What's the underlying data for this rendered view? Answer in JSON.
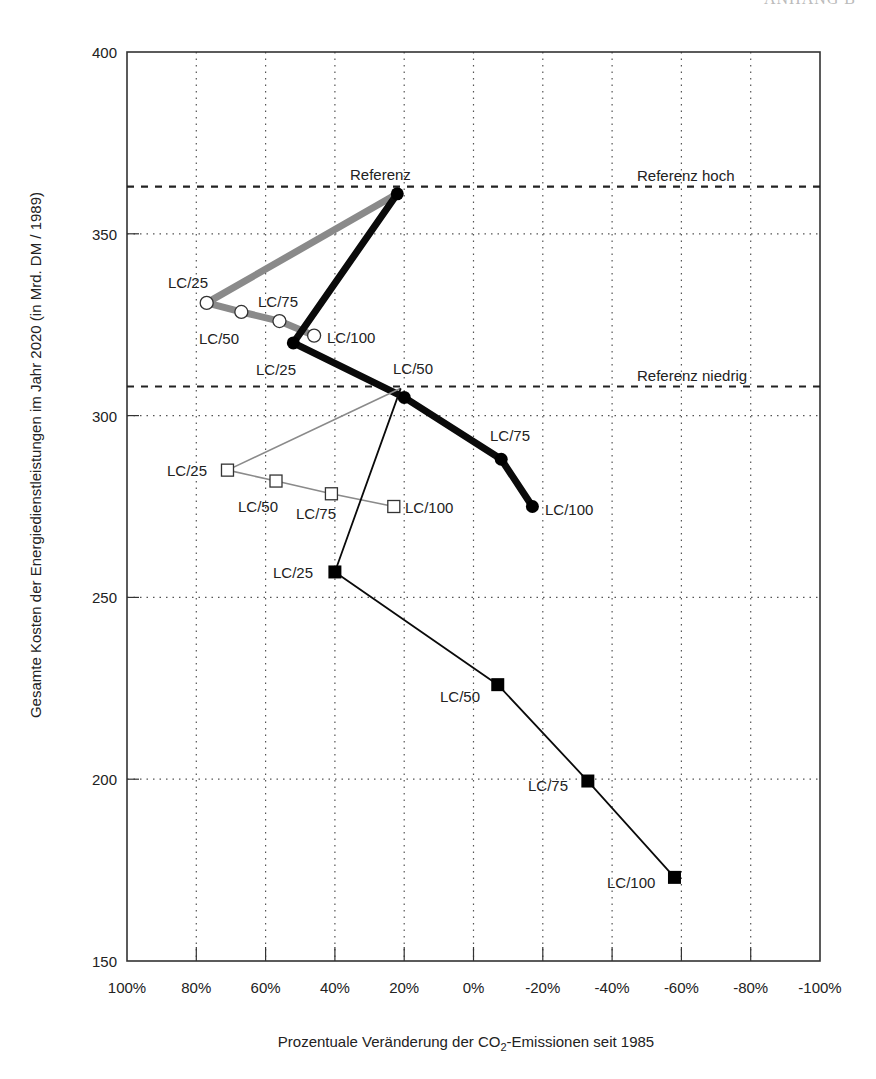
{
  "header_fragment": "ANHANG B",
  "chart_data": {
    "type": "line",
    "title": "",
    "xlabel": "Prozentuale Veränderung der CO2-Emissionen seit 1985",
    "xlabel_parts": {
      "pre": "Prozentuale Veränderung der CO",
      "sub": "2",
      "post": "-Emissionen seit 1985"
    },
    "ylabel": "Gesamte Kosten der Energiedienstleistungen im Jahr 2020 (in Mrd. DM / 1989)",
    "xlim": [
      100,
      -100
    ],
    "ylim": [
      150,
      400
    ],
    "x_ticks": [
      100,
      80,
      60,
      40,
      20,
      0,
      -20,
      -40,
      -60,
      -80,
      -100
    ],
    "x_tick_labels": [
      "100%",
      "80%",
      "60%",
      "40%",
      "20%",
      "0%",
      "-20%",
      "-40%",
      "-60%",
      "-80%",
      "-100%"
    ],
    "y_ticks": [
      150,
      200,
      250,
      300,
      350,
      400
    ],
    "y_tick_labels": [
      "150",
      "200",
      "250",
      "300",
      "350",
      "400"
    ],
    "grid": true,
    "reference_lines": [
      {
        "name": "Referenz hoch",
        "y": 363
      },
      {
        "name": "Referenz niedrig",
        "y": 308
      }
    ],
    "series": [
      {
        "name": "Referenz hoch – offene Kreise",
        "style": "thick-grey",
        "marker": "open-circle",
        "points": [
          {
            "label": "",
            "x": 22,
            "y": 361
          },
          {
            "label": "LC/25",
            "x": 77,
            "y": 331
          },
          {
            "label": "LC/50",
            "x": 67,
            "y": 328.5
          },
          {
            "label": "LC/75",
            "x": 56,
            "y": 326
          },
          {
            "label": "LC/100",
            "x": 46,
            "y": 322
          }
        ]
      },
      {
        "name": "Referenz hoch – gefüllte Kreise",
        "style": "thick-black",
        "marker": "filled-circle",
        "points": [
          {
            "label": "Referenz",
            "x": 22,
            "y": 361
          },
          {
            "label": "LC/25",
            "x": 52,
            "y": 320
          },
          {
            "label": "LC/50",
            "x": 20,
            "y": 305
          },
          {
            "label": "LC/75",
            "x": -8,
            "y": 288
          },
          {
            "label": "LC/100",
            "x": -17,
            "y": 275
          }
        ]
      },
      {
        "name": "Referenz niedrig – offene Quadrate",
        "style": "thin-grey",
        "marker": "open-square",
        "points": [
          {
            "label": "",
            "x": 21,
            "y": 307.5
          },
          {
            "label": "LC/25",
            "x": 71,
            "y": 285
          },
          {
            "label": "LC/50",
            "x": 57,
            "y": 282
          },
          {
            "label": "LC/75",
            "x": 41,
            "y": 278.5
          },
          {
            "label": "LC/100",
            "x": 23,
            "y": 275
          }
        ]
      },
      {
        "name": "Referenz niedrig – gefüllte Quadrate",
        "style": "thin-black",
        "marker": "filled-square",
        "points": [
          {
            "label": "",
            "x": 21,
            "y": 307.5
          },
          {
            "label": "LC/25",
            "x": 40,
            "y": 257
          },
          {
            "label": "LC/50",
            "x": -7,
            "y": 226
          },
          {
            "label": "LC/75",
            "x": -33,
            "y": 199.5
          },
          {
            "label": "LC/100",
            "x": -58,
            "y": 173
          }
        ]
      }
    ],
    "annotations": [
      {
        "text": "Referenz",
        "x": 22,
        "y": 361
      },
      {
        "text": "Referenz hoch",
        "x": -43,
        "y": 363
      },
      {
        "text": "Referenz niedrig",
        "x": -43,
        "y": 308
      }
    ]
  },
  "labels": {
    "s1_lc25": "LC/25",
    "s1_lc50": "LC/50",
    "s1_lc75": "LC/75",
    "s1_lc100": "LC/100",
    "s2_ref": "Referenz",
    "s2_lc25": "LC/25",
    "s2_lc50": "LC/50",
    "s2_lc75": "LC/75",
    "s2_lc100": "LC/100",
    "s3_lc25": "LC/25",
    "s3_lc50": "LC/50",
    "s3_lc75": "LC/75",
    "s3_lc100": "LC/100",
    "s4_lc25": "LC/25",
    "s4_lc50": "LC/50",
    "s4_lc75": "LC/75",
    "s4_lc100": "LC/100",
    "ref_hoch": "Referenz hoch",
    "ref_niedrig": "Referenz niedrig"
  }
}
